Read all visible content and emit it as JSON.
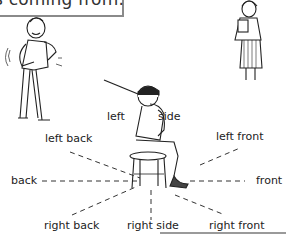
{
  "caption": {
    "text": "s coming from."
  },
  "figures": {
    "left_figure": "man-scratching-figure",
    "right_figure": "girl-with-book-figure",
    "center_figure": "seated-listener-with-stick"
  },
  "directions": {
    "left": "left",
    "side": "side",
    "left_back": "left back",
    "left_front": "left front",
    "back": "back",
    "front": "front",
    "right_back": "right back",
    "right_side": "right side",
    "right_front": "right front"
  },
  "colors": {
    "line": "#333333",
    "border": "#8a8a8a",
    "text": "#222222"
  }
}
